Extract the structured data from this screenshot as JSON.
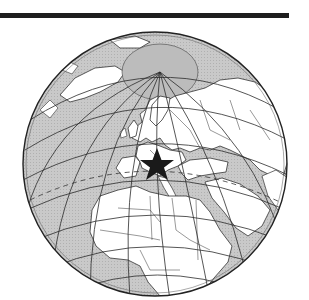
{
  "map": {
    "projection": "orthographic",
    "center_region": "Europe",
    "marker": {
      "type": "star",
      "location": "Central Europe / Alps (northern Italy)",
      "color": "#1a1a1a"
    },
    "colors": {
      "ocean": "#c8c8c8",
      "land": "#ffffff",
      "border": "#333333",
      "graticule": "#2b2b2b",
      "polar_ice": "#bdbdbd",
      "header_rule": "#1e1e1e"
    }
  }
}
